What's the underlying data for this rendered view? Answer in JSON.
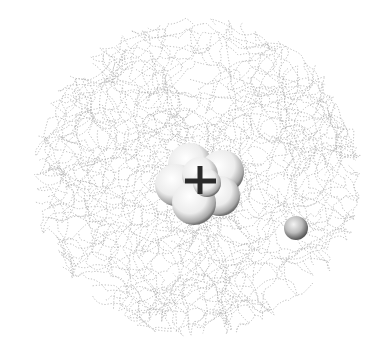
{
  "figure": {
    "background": "#ffffff",
    "electron_cloud": {
      "shape": "tangled dotted paths",
      "color": "#9a9a9a",
      "center": [
        197,
        177
      ],
      "radius_x": 165,
      "radius_y": 160
    },
    "nucleus": {
      "center": [
        200,
        180
      ],
      "sphere_count": 7,
      "sphere_color": "#f2f2f2",
      "symbol": "+",
      "symbol_color": "#2a2a2a"
    },
    "electron": {
      "center": [
        296,
        228
      ],
      "radius": 12,
      "color": "#b8b8b8"
    }
  }
}
